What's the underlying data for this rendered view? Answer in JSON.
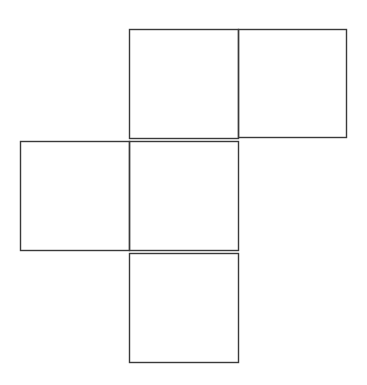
{
  "diagram": {
    "type": "cube-net",
    "stroke_color": "#3a3a3a",
    "background": "#ffffff",
    "squares": [
      {
        "id": "top-left",
        "x": 129,
        "y": 29,
        "size": 109
      },
      {
        "id": "top-right",
        "x": 238,
        "y": 29,
        "size": 108
      },
      {
        "id": "middle-left",
        "x": 20,
        "y": 141,
        "size": 109
      },
      {
        "id": "middle-center",
        "x": 129,
        "y": 141,
        "size": 109
      },
      {
        "id": "bottom",
        "x": 129,
        "y": 253,
        "size": 109
      }
    ]
  }
}
